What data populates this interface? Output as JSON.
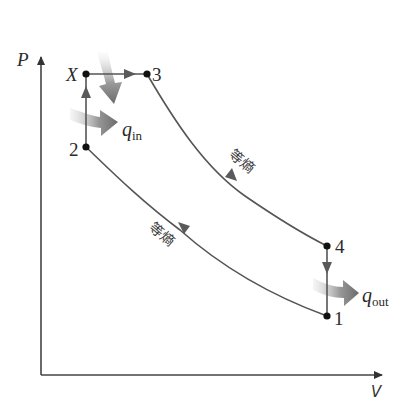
{
  "diagram": {
    "type": "P-V diagram (dual cycle)",
    "axes": {
      "y_label": "P",
      "x_label": "V"
    },
    "points": [
      {
        "id": "X",
        "label": "X",
        "x": 86,
        "y": 74
      },
      {
        "id": "3",
        "label": "3",
        "x": 147,
        "y": 74
      },
      {
        "id": "2",
        "label": "2",
        "x": 86,
        "y": 147
      },
      {
        "id": "4",
        "label": "4",
        "x": 327,
        "y": 246
      },
      {
        "id": "1",
        "label": "1",
        "x": 327,
        "y": 316
      }
    ],
    "processes": [
      {
        "from": "2",
        "to": "X",
        "kind": "constant volume heat addition"
      },
      {
        "from": "X",
        "to": "3",
        "kind": "constant pressure heat addition"
      },
      {
        "from": "3",
        "to": "4",
        "kind": "isentropic expansion",
        "label": "等熵"
      },
      {
        "from": "4",
        "to": "1",
        "kind": "constant volume heat rejection"
      },
      {
        "from": "1",
        "to": "2",
        "kind": "isentropic compression",
        "label": "等熵"
      }
    ],
    "heat_labels": {
      "q_in_main": "q",
      "q_in_sub": "in",
      "q_out_main": "q",
      "q_out_sub": "out"
    },
    "isentropic_label_expansion": "等熵",
    "isentropic_label_compression": "等熵",
    "colors": {
      "line": "#555555",
      "point": "#111111",
      "heat_arrow": "#777777",
      "background": "#ffffff"
    }
  }
}
